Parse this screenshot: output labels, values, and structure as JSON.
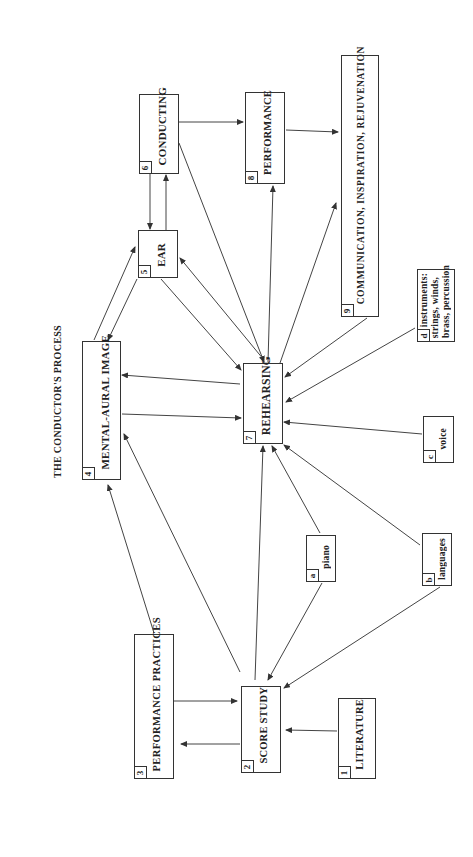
{
  "title": "THE CONDUCTOR'S PROCESS",
  "orientation": "rotated 90° counter-clockwise",
  "nodes": [
    {
      "id": "1",
      "label": "LITERATURE"
    },
    {
      "id": "2",
      "label": "SCORE STUDY"
    },
    {
      "id": "3",
      "label": "PERFORMANCE PRACTICES"
    },
    {
      "id": "4",
      "label": "MENTAL-AURAL IMAGE"
    },
    {
      "id": "5",
      "label": "EAR"
    },
    {
      "id": "6",
      "label": "CONDUCTING"
    },
    {
      "id": "7",
      "label": "REHEARSING"
    },
    {
      "id": "8",
      "label": "PERFORMANCE"
    },
    {
      "id": "9",
      "label": "COMMUNICATION, INSPIRATION, REJUVENATION"
    },
    {
      "id": "a",
      "label": "piano"
    },
    {
      "id": "b",
      "label": "languages"
    },
    {
      "id": "c",
      "label": "voice"
    },
    {
      "id": "d",
      "label_line1": "instruments:",
      "label_line2": "strings, winds,",
      "label_line3": "brass, percussion"
    }
  ],
  "edges": [
    {
      "from": "1",
      "to": "2"
    },
    {
      "from": "2",
      "to": "3"
    },
    {
      "from": "3",
      "to": "2"
    },
    {
      "from": "3",
      "to": "4"
    },
    {
      "from": "2",
      "to": "4"
    },
    {
      "from": "2",
      "to": "7"
    },
    {
      "from": "a",
      "to": "2"
    },
    {
      "from": "b",
      "to": "2"
    },
    {
      "from": "a",
      "to": "7"
    },
    {
      "from": "b",
      "to": "7"
    },
    {
      "from": "c",
      "to": "7"
    },
    {
      "from": "d",
      "to": "7"
    },
    {
      "from": "4",
      "to": "7"
    },
    {
      "from": "7",
      "to": "4"
    },
    {
      "from": "4",
      "to": "5"
    },
    {
      "from": "5",
      "to": "4"
    },
    {
      "from": "5",
      "to": "7"
    },
    {
      "from": "7",
      "to": "5"
    },
    {
      "from": "5",
      "to": "6"
    },
    {
      "from": "6",
      "to": "5"
    },
    {
      "from": "6",
      "to": "7"
    },
    {
      "from": "6",
      "to": "8"
    },
    {
      "from": "7",
      "to": "8"
    },
    {
      "from": "8",
      "to": "9"
    },
    {
      "from": "7",
      "to": "9"
    },
    {
      "from": "9",
      "to": "7"
    }
  ]
}
